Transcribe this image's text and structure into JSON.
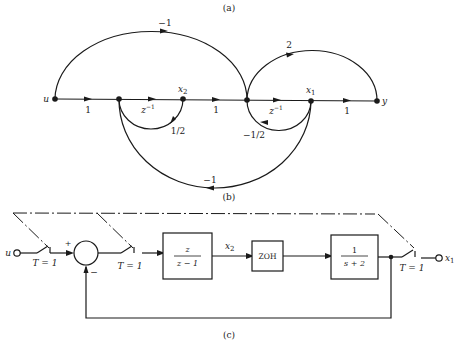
{
  "figure": {
    "caption_a": "(a)",
    "caption_b": "(b)",
    "caption_c": "(c)"
  },
  "signal_flow_graph": {
    "nodes": [
      {
        "id": "u",
        "label": "u"
      },
      {
        "id": "n1",
        "label": ""
      },
      {
        "id": "x2",
        "label": "x",
        "sub": "2"
      },
      {
        "id": "n3",
        "label": ""
      },
      {
        "id": "x1",
        "label": "x",
        "sub": "1"
      },
      {
        "id": "y",
        "label": "y"
      }
    ],
    "branches": [
      {
        "from": "u",
        "to": "n1",
        "gain": "1"
      },
      {
        "from": "n1",
        "to": "x2",
        "gain": "z",
        "sup": "−1"
      },
      {
        "from": "x2",
        "to": "n3",
        "gain": "1"
      },
      {
        "from": "n3",
        "to": "x1",
        "gain": "z",
        "sup": "−1"
      },
      {
        "from": "x1",
        "to": "y",
        "gain": "1"
      },
      {
        "from": "u",
        "to": "n3",
        "gain": "−1"
      },
      {
        "from": "n3",
        "to": "y",
        "gain": "2"
      },
      {
        "from": "x2",
        "to": "n1",
        "gain": "1/2"
      },
      {
        "from": "x1",
        "to": "n3",
        "gain": "−1/2"
      },
      {
        "from": "x1",
        "to": "n1",
        "gain": "−1"
      }
    ]
  },
  "block_diagram": {
    "input": "u",
    "output": "x",
    "output_sub": "1",
    "sampler_label": "T = 1",
    "sum_plus": "+",
    "sum_minus": "−",
    "block1": {
      "num": "z",
      "den": "z − 1"
    },
    "signal_x2": "x",
    "signal_x2_sub": "2",
    "block2": {
      "label": "ZOH"
    },
    "block3": {
      "num": "1",
      "den": "s + 2"
    }
  }
}
